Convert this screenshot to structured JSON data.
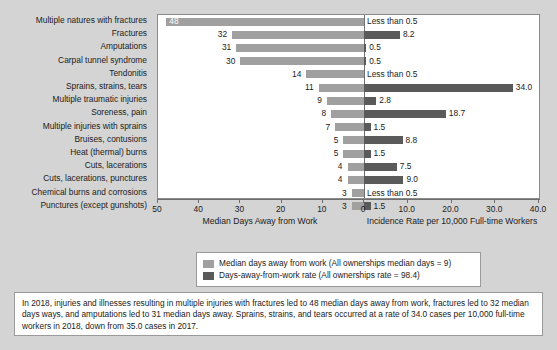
{
  "chart_data": {
    "type": "bar",
    "subtype": "diverging-paired-horizontal",
    "title": "",
    "categories": [
      "Multiple natures with fractures",
      "Fractures",
      "Amputations",
      "Carpal tunnel syndrome",
      "Tendonitis",
      "Sprains, strains, tears",
      "Multiple traumatic injuries",
      "Soreness, pain",
      "Multiple injuries with sprains",
      "Bruises, contusions",
      "Heat (thermal) burns",
      "Cuts, lacerations",
      "Cuts, lacerations, punctures",
      "Chemical burns and corrosions",
      "Punctures (except gunshots)"
    ],
    "series": [
      {
        "name": "Median days away from work (All ownerships median days = 9)",
        "axis": "left",
        "color": "#a0a0a0",
        "values": [
          48,
          32,
          31,
          30,
          14,
          11,
          9,
          8,
          7,
          5,
          5,
          4,
          4,
          3,
          3
        ],
        "labels": [
          "48",
          "32",
          "31",
          "30",
          "14",
          "11",
          "9",
          "8",
          "7",
          "5",
          "5",
          "4",
          "4",
          "3",
          "3"
        ]
      },
      {
        "name": "Days-away-from-work rate (All ownerships rate = 98.4)",
        "axis": "right",
        "color": "#5a5a5a",
        "values": [
          0,
          8.2,
          0.5,
          0.5,
          0,
          34.0,
          2.8,
          18.7,
          1.5,
          8.8,
          1.5,
          7.5,
          9.0,
          0,
          1.5
        ],
        "labels": [
          "Less than 0.5",
          "8.2",
          "0.5",
          "0.5",
          "Less than 0.5",
          "34.0",
          "2.8",
          "18.7",
          "1.5",
          "8.8",
          "1.5",
          "7.5",
          "9.0",
          "Less than 0.5",
          "1.5"
        ]
      }
    ],
    "left_axis": {
      "label": "Median Days Away from Work",
      "ticks": [
        "50",
        "40",
        "30",
        "20",
        "10",
        "0"
      ],
      "range": [
        50,
        0
      ],
      "direction": "reversed"
    },
    "right_axis": {
      "label": "Incidence Rate per 10,000 Full-time Workers",
      "ticks": [
        "0",
        "10.0",
        "20.0",
        "30.0",
        "40.0"
      ],
      "range": [
        0,
        40
      ]
    },
    "grid": false,
    "legend_position": "bottom"
  },
  "legend": {
    "items": [
      {
        "swatch": "light",
        "text": "Median days away from work (All ownerships median days = 9)"
      },
      {
        "swatch": "dark",
        "text": "Days-away-from-work rate (All ownerships rate = 98.4)"
      }
    ]
  },
  "footnote": {
    "text": "In 2018, injuries and illnesses resulting in multiple injuries with fractures led to 48 median days away from work, fractures led to 32 median days ways, and amputations led to 31 median days away. Sprains, strains, and tears occurred at a rate of 34.0 cases per 10,000 full-time workers in 2018, down from 35.0 cases in 2017."
  },
  "colors": {
    "background": "#d4d4d4",
    "plot_background": "#ffffff",
    "series_light": "#a0a0a0",
    "series_dark": "#5a5a5a",
    "axis": "#6e6e6e"
  }
}
